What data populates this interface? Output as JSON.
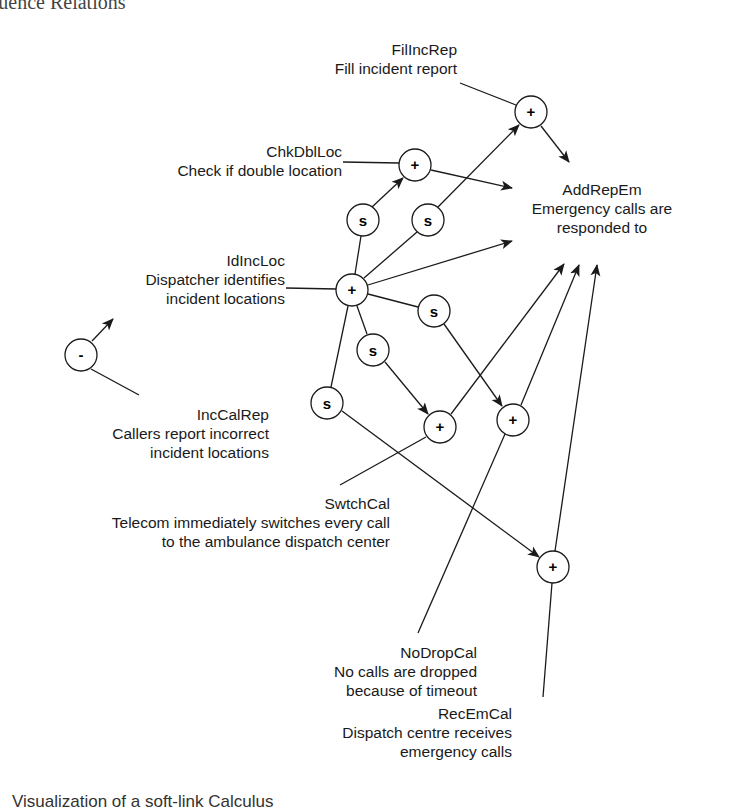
{
  "heading": "the Influence Relations",
  "caption": "Visualization of a soft-link Calculus",
  "goals": {
    "FilIncRep": {
      "code": "FilIncRep",
      "desc": "Fill incident report"
    },
    "ChkDblLoc": {
      "code": "ChkDblLoc",
      "desc": "Check if double location"
    },
    "AddRepEm": {
      "code": "AddRepEm",
      "desc1": "Emergency calls are",
      "desc2": "responded to"
    },
    "IdIncLoc": {
      "code": "IdIncLoc",
      "desc1": "Dispatcher identifies",
      "desc2": "incident locations"
    },
    "IncCalRep": {
      "code": "IncCalRep",
      "desc1": "Callers report incorrect",
      "desc2": "incident locations"
    },
    "SwtchCal": {
      "code": "SwtchCal",
      "desc1": "Telecom immediately switches every call",
      "desc2": "to the ambulance dispatch center"
    },
    "NoDropCal": {
      "code": "NoDropCal",
      "desc1": "No calls are dropped",
      "desc2": "because of timeout"
    },
    "RecEmCal": {
      "code": "RecEmCal",
      "desc1": "Dispatch centre receives",
      "desc2": "emergency calls"
    }
  },
  "symbols": {
    "plus": "+",
    "minus": "-",
    "soft": "s"
  },
  "nodes": [
    {
      "id": "n-fil",
      "type": "plus",
      "x": 531,
      "y": 112
    },
    {
      "id": "n-chk",
      "type": "plus",
      "x": 415,
      "y": 165
    },
    {
      "id": "n-s1",
      "type": "soft",
      "x": 363,
      "y": 220
    },
    {
      "id": "n-s2",
      "type": "soft",
      "x": 428,
      "y": 220
    },
    {
      "id": "n-id",
      "type": "plus",
      "x": 352,
      "y": 290
    },
    {
      "id": "n-s3",
      "type": "soft",
      "x": 434,
      "y": 311
    },
    {
      "id": "n-s4",
      "type": "soft",
      "x": 373,
      "y": 350
    },
    {
      "id": "n-s5",
      "type": "soft",
      "x": 327,
      "y": 403
    },
    {
      "id": "n-sw",
      "type": "plus",
      "x": 440,
      "y": 427
    },
    {
      "id": "n-nd",
      "type": "plus",
      "x": 513,
      "y": 420
    },
    {
      "id": "n-rec",
      "type": "plus",
      "x": 553,
      "y": 567
    },
    {
      "id": "n-neg",
      "type": "minus",
      "x": 81,
      "y": 355
    }
  ],
  "colors": {
    "ink": "#1a1a1a",
    "background": "#ffffff"
  }
}
